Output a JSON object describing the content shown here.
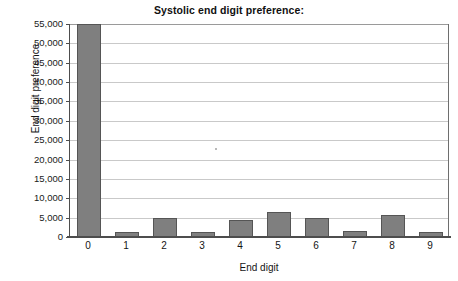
{
  "chart_data": {
    "type": "bar",
    "title": "Systolic end digit preference:",
    "xlabel": "End digit",
    "ylabel": "End digit preference",
    "categories": [
      "0",
      "1",
      "2",
      "3",
      "4",
      "5",
      "6",
      "7",
      "8",
      "9"
    ],
    "values": [
      55000,
      1200,
      5000,
      1300,
      4500,
      6500,
      5000,
      1500,
      5800,
      1200
    ],
    "ylim": [
      0,
      55000
    ],
    "ytick_values": [
      0,
      5000,
      10000,
      15000,
      20000,
      25000,
      30000,
      35000,
      40000,
      45000,
      50000,
      55000
    ],
    "ytick_labels": [
      "0",
      "5,000",
      "10,000",
      "15,000",
      "20,000",
      "25,000",
      "30,000",
      "35,000",
      "40,000",
      "45,000",
      "50,000",
      "55,000"
    ],
    "grid": true,
    "legend": "none",
    "series_color": "#7f7f7f",
    "series_border_color": "#555555",
    "axis_color": "#4d4d4d",
    "grid_color": "#c9c9c9"
  }
}
